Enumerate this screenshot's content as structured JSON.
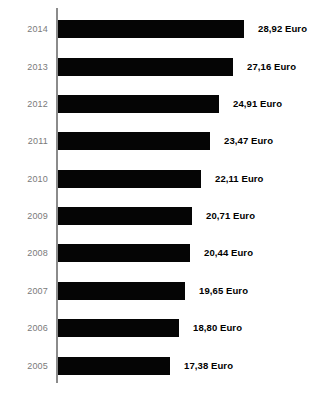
{
  "chart": {
    "type": "bar",
    "orientation": "horizontal",
    "currency_suffix": "Euro",
    "axis_color": "#8b8b8b",
    "bar_color": "#050505",
    "year_label_color": "#7a7a7a",
    "value_label_color": "#000000",
    "background": "#ffffff"
  },
  "chart_data": {
    "type": "bar",
    "title": "",
    "subtitle": "",
    "xlabel": "",
    "ylabel": "",
    "grid": false,
    "legend": false,
    "orientation": "horizontal",
    "categories": [
      "2014",
      "2013",
      "2012",
      "2011",
      "2010",
      "2009",
      "2008",
      "2007",
      "2006",
      "2005"
    ],
    "values": [
      28.92,
      27.16,
      24.91,
      23.47,
      22.11,
      20.71,
      20.44,
      19.65,
      18.8,
      17.38
    ],
    "value_labels": [
      "28,92 Euro",
      "27,16 Euro",
      "24,91 Euro",
      "23,47 Euro",
      "22,11 Euro",
      "20,71 Euro",
      "20,44 Euro",
      "19,65 Euro",
      "18,80 Euro",
      "17,38 Euro"
    ],
    "unit": "Euro",
    "decimal_separator": ",",
    "xlim": [
      0,
      28.92
    ],
    "ylim": null
  },
  "rows": [
    {
      "year": "2014",
      "value": 28.92,
      "label": "28,92 Euro",
      "bar_width": 186,
      "top": 20
    },
    {
      "year": "2013",
      "value": 27.16,
      "label": "27,16 Euro",
      "bar_width": 175,
      "top": 58
    },
    {
      "year": "2012",
      "value": 24.91,
      "label": "24,91 Euro",
      "bar_width": 161,
      "top": 95
    },
    {
      "year": "2011",
      "value": 23.47,
      "label": "23,47 Euro",
      "bar_width": 152,
      "top": 132
    },
    {
      "year": "2010",
      "value": 22.11,
      "label": "22,11 Euro",
      "bar_width": 143,
      "top": 170
    },
    {
      "year": "2009",
      "value": 20.71,
      "label": "20,71 Euro",
      "bar_width": 134,
      "top": 207
    },
    {
      "year": "2008",
      "value": 20.44,
      "label": "20,44 Euro",
      "bar_width": 132,
      "top": 244
    },
    {
      "year": "2007",
      "value": 19.65,
      "label": "19,65 Euro",
      "bar_width": 127,
      "top": 282
    },
    {
      "year": "2006",
      "value": 18.8,
      "label": "18,80 Euro",
      "bar_width": 121,
      "top": 319
    },
    {
      "year": "2005",
      "value": 17.38,
      "label": "17,38 Euro",
      "bar_width": 112,
      "top": 357
    }
  ]
}
